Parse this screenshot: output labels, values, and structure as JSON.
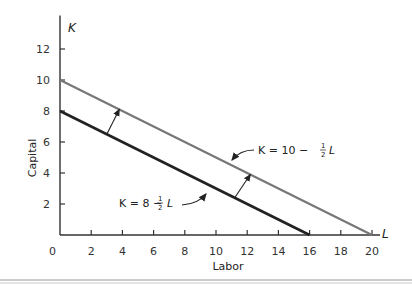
{
  "chart_data": {
    "type": "line",
    "title": "",
    "xlabel": "Labor",
    "ylabel": "Capital",
    "x_axis_var": "L",
    "y_axis_var": "K",
    "xlim": [
      0,
      20
    ],
    "ylim": [
      0,
      13
    ],
    "x_ticks": [
      2,
      4,
      6,
      8,
      10,
      12,
      14,
      16,
      18,
      20
    ],
    "y_ticks": [
      2,
      4,
      6,
      8,
      10,
      12
    ],
    "origin_label": "0",
    "grid": false,
    "series": [
      {
        "name": "K = 8 - 1/2 L",
        "label_main": "K = 8 − ",
        "label_num": "1",
        "label_den": "2",
        "label_var": "L",
        "color": "#222222",
        "x": [
          0,
          16
        ],
        "y": [
          8,
          0
        ]
      },
      {
        "name": "K = 10 - 1/2 L",
        "label_main": "K = 10 − ",
        "label_num": "1",
        "label_den": "2",
        "label_var": "L",
        "color": "#777777",
        "x": [
          0,
          20
        ],
        "y": [
          10,
          0
        ]
      }
    ],
    "annotations": [
      {
        "type": "shift-arrow",
        "from": [
          3,
          6.5
        ],
        "to": [
          3.8,
          8.1
        ]
      },
      {
        "type": "shift-arrow",
        "from": [
          11.2,
          2.4
        ],
        "to": [
          12.2,
          3.9
        ]
      }
    ]
  }
}
